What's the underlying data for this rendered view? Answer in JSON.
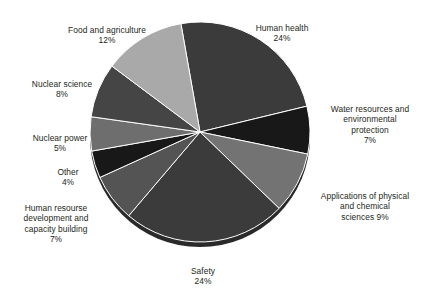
{
  "chart_data": {
    "type": "pie",
    "title": "",
    "subtitle": "",
    "xlabel": "",
    "ylabel": "",
    "legend_position": "outside-labels",
    "grid": false,
    "units": "%",
    "total": 100,
    "start_angle_deg": -10,
    "direction": "clockwise",
    "categories": [
      "Human health",
      "Water resources and environmental protection",
      "Applications of physical and chemical sciences",
      "Safety",
      "Human resourse development and capacity building",
      "Other",
      "Nuclear power",
      "Nuclear science",
      "Food and agriculture"
    ],
    "values": [
      24,
      7,
      9,
      24,
      7,
      4,
      5,
      8,
      12
    ],
    "colors": [
      "#3b3b3b",
      "#181818",
      "#737373",
      "#3b3b3b",
      "#545454",
      "#181818",
      "#6e6e6e",
      "#454545",
      "#a9a9a9"
    ],
    "slices": [
      {
        "label": "Human health",
        "value": 24,
        "value_text": "24%",
        "color": "#3b3b3b"
      },
      {
        "label": "Water resources and environmental protection",
        "value": 7,
        "value_text": "7%",
        "color": "#181818"
      },
      {
        "label": "Applications of physical and chemical sciences",
        "value": 9,
        "value_text": "9%",
        "color": "#737373"
      },
      {
        "label": "Safety",
        "value": 24,
        "value_text": "24%",
        "color": "#3b3b3b"
      },
      {
        "label": "Human resourse development and capacity building",
        "value": 7,
        "value_text": "7%",
        "color": "#545454"
      },
      {
        "label": "Other",
        "value": 4,
        "value_text": "4%",
        "color": "#181818"
      },
      {
        "label": "Nuclear power",
        "value": 5,
        "value_text": "5%",
        "color": "#6e6e6e"
      },
      {
        "label": "Nuclear science",
        "value": 8,
        "value_text": "8%",
        "color": "#454545"
      },
      {
        "label": "Food and agriculture",
        "value": 12,
        "value_text": "12%",
        "color": "#a9a9a9"
      }
    ]
  },
  "labels": {
    "human_health": {
      "name": "Human health",
      "pct": "24%"
    },
    "water": {
      "name": "Water resources and\nenvironmental\nprotection",
      "pct": "7%"
    },
    "applications": {
      "name": "Applications of physical\nand chemical",
      "pct": "sciences 9%"
    },
    "safety": {
      "name": "Safety",
      "pct": "24%"
    },
    "hrd": {
      "name": "Human resourse\ndevelopment and\ncapacity building",
      "pct": "7%"
    },
    "other": {
      "name": "Other",
      "pct": "4%"
    },
    "nuclear_power": {
      "name": "Nuclear power",
      "pct": "5%"
    },
    "nuclear_science": {
      "name": "Nuclear science",
      "pct": "8%"
    },
    "food": {
      "name": "Food and agriculture",
      "pct": "12%"
    }
  },
  "style": {
    "background": "#ffffff",
    "text_color": "#231f20",
    "slice_edge": "#ffffff",
    "shadow_color": "#2a2a2a"
  }
}
